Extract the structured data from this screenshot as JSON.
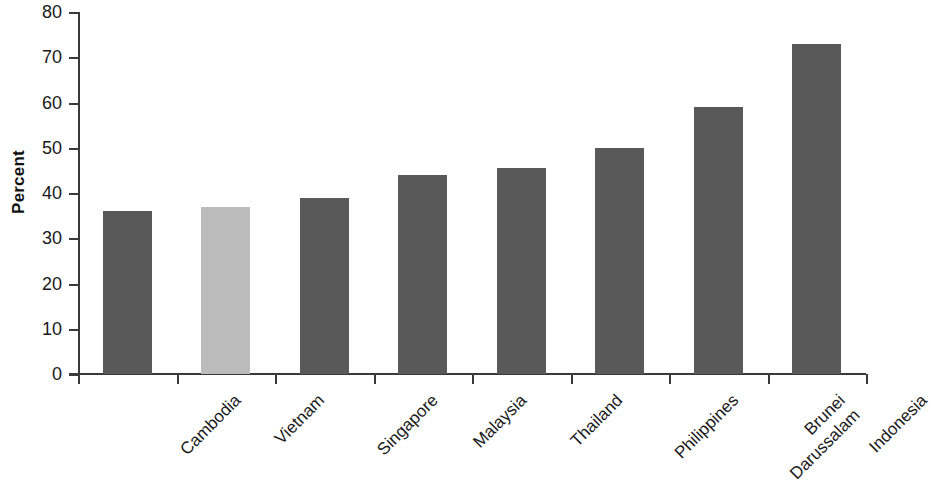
{
  "chart_data": {
    "type": "bar",
    "title": "",
    "subtitle": "",
    "xlabel": "",
    "ylabel": "Percent",
    "ylim": [
      0,
      80
    ],
    "ytick_step": 10,
    "yticks": [
      0,
      10,
      20,
      30,
      40,
      50,
      60,
      70,
      80
    ],
    "ytick_labels": [
      "0",
      "10",
      "20",
      "30",
      "40",
      "50",
      "60",
      "70",
      "80"
    ],
    "grid": false,
    "legend": null,
    "legend_position": "none",
    "annotations": [],
    "categories": [
      "Cambodia",
      "Vietnam",
      "Singapore",
      "Malaysia",
      "Thailand",
      "Philippines",
      "Brunei Darussalam",
      "Indonesia"
    ],
    "category_label_lines": [
      [
        "Cambodia"
      ],
      [
        "Vietnam"
      ],
      [
        "Singapore"
      ],
      [
        "Malaysia"
      ],
      [
        "Thailand"
      ],
      [
        "Philippines"
      ],
      [
        "Brunei",
        "Darussalam"
      ],
      [
        "Indonesia"
      ]
    ],
    "values": [
      36,
      37,
      39,
      44,
      45.5,
      50,
      59,
      73
    ],
    "bar_colors": [
      "#595959",
      "#bcbcbc",
      "#595959",
      "#595959",
      "#595959",
      "#595959",
      "#595959",
      "#595959"
    ],
    "highlighted_category": "Vietnam",
    "colors": {
      "bar_default": "#595959",
      "bar_highlight": "#bcbcbc",
      "axis": "#3a3a3a",
      "text": "#1a1a1a",
      "background": "#ffffff"
    }
  }
}
